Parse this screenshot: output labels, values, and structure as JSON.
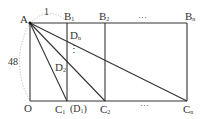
{
  "labels": {
    "A": "A",
    "O": "O",
    "one": "1",
    "side": "48",
    "B1": "B",
    "B1_sub": "1",
    "B2": "B",
    "B2_sub": "2",
    "Bn": "B",
    "Bn_sub": "n",
    "C1": "C",
    "C1_sub": "1",
    "D1": "(D",
    "D1_sub": "1",
    "D1_close": ")",
    "C2": "C",
    "C2_sub": "2",
    "Cn": "C",
    "Cn_sub": "n",
    "D2": "D",
    "D2_sub": "2",
    "Dn": "D",
    "Dn_sub": "n",
    "dots_top": "···",
    "dots_bottom": "···",
    "dots_vertical": "⋮"
  },
  "colors": {
    "line": "#333333",
    "dashed": "#999999"
  }
}
